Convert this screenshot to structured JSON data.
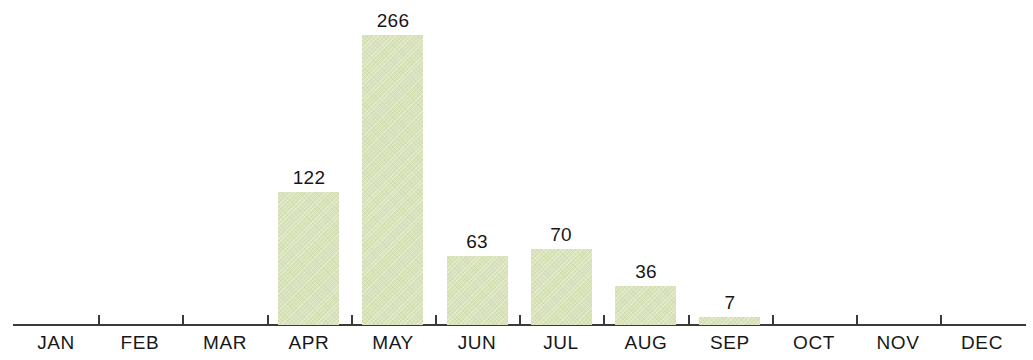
{
  "chart_data": {
    "type": "bar",
    "title": "",
    "subtitle": "",
    "xlabel": "",
    "ylabel": "",
    "categories": [
      "JAN",
      "FEB",
      "MAR",
      "APR",
      "MAY",
      "JUN",
      "JUL",
      "AUG",
      "SEP",
      "OCT",
      "NOV",
      "DEC"
    ],
    "values": [
      0,
      0,
      0,
      122,
      266,
      63,
      70,
      36,
      7,
      0,
      0,
      0
    ],
    "data_labels": [
      "",
      "",
      "",
      "122",
      "266",
      "63",
      "70",
      "36",
      "7",
      "",
      "",
      ""
    ],
    "ylim": [
      0,
      266
    ],
    "grid": false,
    "legend": null,
    "bar_color": "#d9e3ba",
    "axis_color": "#3a3a38",
    "text_color": "#17171a"
  }
}
